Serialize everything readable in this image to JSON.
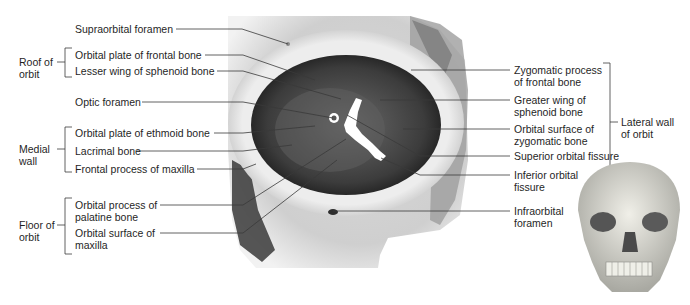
{
  "diagram": {
    "left_groups": [
      {
        "label_line1": "Roof of",
        "label_line2": "orbit"
      },
      {
        "label_line1": "Medial",
        "label_line2": "wall"
      },
      {
        "label_line1": "Floor of",
        "label_line2": "orbit"
      }
    ],
    "right_groups": [
      {
        "label_line1": "Lateral wall",
        "label_line2": "of orbit"
      }
    ],
    "left_labels": [
      {
        "line1": "Supraorbital foramen",
        "line2": ""
      },
      {
        "line1": "Orbital plate of frontal bone",
        "line2": ""
      },
      {
        "line1": "Lesser wing of sphenoid bone",
        "line2": ""
      },
      {
        "line1": "Optic foramen",
        "line2": ""
      },
      {
        "line1": "Orbital plate of ethmoid bone",
        "line2": ""
      },
      {
        "line1": "Lacrimal bone",
        "line2": ""
      },
      {
        "line1": "Frontal process of maxilla",
        "line2": ""
      },
      {
        "line1": "Orbital process of",
        "line2": "palatine bone"
      },
      {
        "line1": "Orbital surface of",
        "line2": "maxilla"
      }
    ],
    "right_labels": [
      {
        "line1": "Zygomatic process",
        "line2": "of frontal bone"
      },
      {
        "line1": "Greater wing of",
        "line2": "sphenoid bone"
      },
      {
        "line1": "Orbital surface of",
        "line2": "zygomatic bone"
      },
      {
        "line1": "Superior orbital fissure",
        "line2": ""
      },
      {
        "line1": "Inferior orbital",
        "line2": "fissure"
      },
      {
        "line1": "Infraorbital",
        "line2": "foramen"
      }
    ],
    "colors": {
      "bone_light": "#e8e8e8",
      "bone_mid": "#b8b8b8",
      "orbit_dark": "#3a3a3a",
      "leader": "#333333"
    }
  }
}
